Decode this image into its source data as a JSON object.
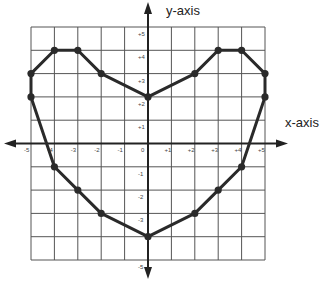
{
  "chart_data": {
    "type": "line",
    "title": "",
    "xlabel": "x-axis",
    "ylabel": "y-axis",
    "xlim": [
      -5,
      5
    ],
    "ylim": [
      -5,
      5
    ],
    "grid": true,
    "x_ticks": [
      "-5",
      "-4",
      "-3",
      "-2",
      "-1",
      "0",
      "+1",
      "+2",
      "+3",
      "+4",
      "+5"
    ],
    "y_ticks": [
      "+5",
      "+4",
      "+3",
      "+2",
      "+1",
      "-1",
      "-2",
      "-3",
      "-5"
    ],
    "y_tick_values": [
      5,
      4,
      3,
      2,
      1,
      -1,
      -2,
      -3,
      -5
    ],
    "series": [
      {
        "name": "heart",
        "closed": true,
        "points": [
          [
            0,
            2
          ],
          [
            -2,
            3
          ],
          [
            -3,
            4
          ],
          [
            -4,
            4
          ],
          [
            -5,
            3
          ],
          [
            -5,
            2
          ],
          [
            -4,
            -1
          ],
          [
            -3,
            -2
          ],
          [
            -2,
            -3
          ],
          [
            0,
            -4
          ],
          [
            2,
            -3
          ],
          [
            3,
            -2
          ],
          [
            4,
            -1
          ],
          [
            5,
            2
          ],
          [
            5,
            3
          ],
          [
            4,
            4
          ],
          [
            3,
            4
          ],
          [
            2,
            3
          ]
        ]
      }
    ],
    "colors": {
      "line": "#2a2a2a",
      "grid": "#555555",
      "axis": "#222222"
    }
  }
}
